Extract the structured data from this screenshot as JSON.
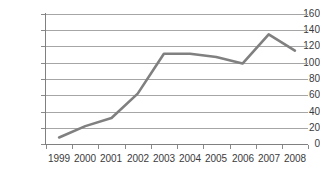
{
  "chart_data": {
    "type": "line",
    "title": "",
    "subtitle": "",
    "xlabel": "",
    "ylabel": "",
    "categories": [
      "1999",
      "2000",
      "2001",
      "2002",
      "2003",
      "2004",
      "2005",
      "2006",
      "2007",
      "2008"
    ],
    "series": [
      {
        "name": "series-1",
        "color": "#808080",
        "values": [
          8,
          22,
          32,
          62,
          111,
          111,
          107,
          99,
          135,
          115
        ]
      }
    ],
    "ylim": [
      0,
      160
    ],
    "ytick_values": [
      0,
      20,
      40,
      60,
      80,
      100,
      120,
      140,
      160
    ],
    "ytick_labels": [
      "0",
      "20",
      "40",
      "60",
      "80",
      "100",
      "120",
      "140",
      "160"
    ],
    "grid": "horizontal",
    "legend": "none",
    "gridline_color": "#a6a6a6",
    "axis_color": "#808080",
    "background_color": "#ffffff",
    "text_color": "#3b3b3b"
  }
}
